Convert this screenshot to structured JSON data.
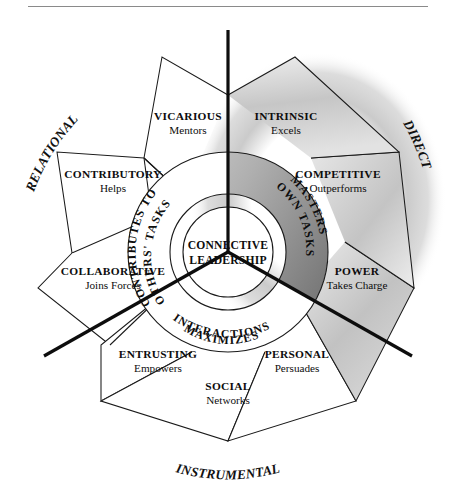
{
  "figure": {
    "center_label_line1": "CONNECTIVE",
    "center_label_line2": "LEADERSHIP"
  },
  "colors": {
    "ink": "#0d0d0d",
    "shadow_gray": "#9a9a9a",
    "petal_shade": "#c9c9c9",
    "ring_shade": "#b5b5b5",
    "paper": "#ffffff",
    "rule": "#8a8a8a"
  },
  "domains": [
    {
      "id": "relational",
      "label": "RELATIONAL",
      "position": "upper-left"
    },
    {
      "id": "direct",
      "label": "DIRECT",
      "position": "upper-right"
    },
    {
      "id": "instrumental",
      "label": "INSTRUMENTAL",
      "position": "bottom"
    }
  ],
  "rings": [
    {
      "id": "contributes",
      "line1": "CONTRIBUTES TO",
      "line2": "OTHERS' TASKS",
      "sector": "upper-left"
    },
    {
      "id": "masters",
      "line1": "MASTERS",
      "line2": "OWN TASKS",
      "sector": "upper-right"
    },
    {
      "id": "maximizes",
      "line1": "MAXIMIZES",
      "line2": "INTERACTIONS",
      "sector": "bottom"
    }
  ],
  "styles": [
    {
      "id": "vicarious",
      "name": "VICARIOUS",
      "verb": "Mentors",
      "domain": "relational",
      "shaded": false
    },
    {
      "id": "contributory",
      "name": "CONTRIBUTORY",
      "verb": "Helps",
      "domain": "relational",
      "shaded": false
    },
    {
      "id": "collaborative",
      "name": "COLLABORATIVE",
      "verb": "Joins Forces",
      "domain": "relational",
      "shaded": false
    },
    {
      "id": "intrinsic",
      "name": "INTRINSIC",
      "verb": "Excels",
      "domain": "direct",
      "shaded": true
    },
    {
      "id": "competitive",
      "name": "COMPETITIVE",
      "verb": "Outperforms",
      "domain": "direct",
      "shaded": true
    },
    {
      "id": "power",
      "name": "POWER",
      "verb": "Takes Charge",
      "domain": "direct",
      "shaded": true
    },
    {
      "id": "entrusting",
      "name": "ENTRUSTING",
      "verb": "Empowers",
      "domain": "instrumental",
      "shaded": false
    },
    {
      "id": "social",
      "name": "SOCIAL",
      "verb": "Networks",
      "domain": "instrumental",
      "shaded": false
    },
    {
      "id": "personal",
      "name": "PERSONAL",
      "verb": "Persuades",
      "domain": "instrumental",
      "shaded": false
    }
  ],
  "axes": [
    {
      "id": "axis-vertical",
      "from": "top",
      "to": "center"
    },
    {
      "id": "axis-lower-left",
      "from": "center",
      "to": "lower-left"
    },
    {
      "id": "axis-lower-right",
      "from": "center",
      "to": "lower-right"
    }
  ]
}
